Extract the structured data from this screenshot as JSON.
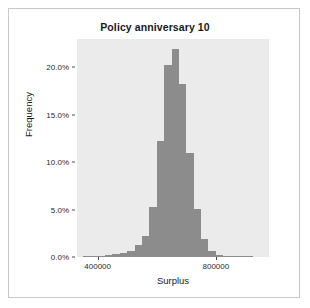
{
  "chart_data": {
    "type": "bar",
    "title": "Policy anniversary 10",
    "xlabel": "Surplus",
    "ylabel": "Frequency",
    "xlim": [
      330000,
      980000
    ],
    "ylim": [
      0,
      23.0
    ],
    "grid": false,
    "legend": null,
    "bar_color": "#8c8c8c",
    "panel_color": "#ebebeb",
    "bin_width": 25000,
    "ytick_values": [
      0,
      5,
      10,
      15,
      20
    ],
    "ytick_labels": [
      "0.0%",
      "5.0%",
      "10.0%",
      "15.0%",
      "20.0%"
    ],
    "xtick_values": [
      400000,
      800000
    ],
    "xtick_labels": [
      "400000",
      "800000"
    ],
    "categories": [
      "350000",
      "375000",
      "400000",
      "425000",
      "450000",
      "475000",
      "500000",
      "525000",
      "550000",
      "575000",
      "600000",
      "625000",
      "650000",
      "675000",
      "700000",
      "725000",
      "750000",
      "775000",
      "800000",
      "825000",
      "850000",
      "875000",
      "900000"
    ],
    "values": [
      0.05,
      0.1,
      0.15,
      0.2,
      0.3,
      0.4,
      0.6,
      1.3,
      2.2,
      5.3,
      12.2,
      20.3,
      21.9,
      18.3,
      11.0,
      5.1,
      1.9,
      0.6,
      0.25,
      0.15,
      0.1,
      0.05,
      0.03
    ]
  }
}
